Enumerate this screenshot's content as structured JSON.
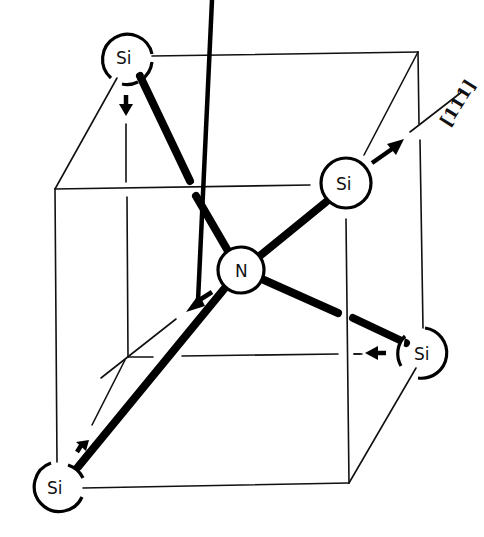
{
  "figure": {
    "center_atom": {
      "label": "N"
    },
    "neighbor_atoms": [
      {
        "id": "si-top-left",
        "label": "Si"
      },
      {
        "id": "si-upper-right",
        "label": "Si"
      },
      {
        "id": "si-lower-right",
        "label": "Si"
      },
      {
        "id": "si-bottom-left",
        "label": "Si"
      }
    ],
    "direction_label": "[111]"
  }
}
